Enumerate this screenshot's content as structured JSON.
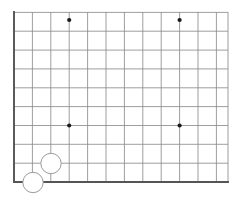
{
  "figure": {
    "kind": "go-board-corner-diagram",
    "width": 245,
    "height": 200,
    "background_color": "#ffffff"
  },
  "board": {
    "orientation": "lower-left-corner",
    "edge_line_color": "#555555",
    "edge_line_width": 1.9,
    "grid_line_color": "#8d8d8d",
    "grid_line_width": 0.85,
    "origin_x": 14,
    "origin_y": 182,
    "cell_width": 18.4,
    "cell_height": 18.85,
    "columns_shown": 12,
    "rows_shown": 9,
    "left_edge_x": 14,
    "bottom_edge_y": 182,
    "right_extent_x": 228,
    "top_extent_y": 12,
    "vertical_line_x": [
      14,
      32.4,
      50.8,
      69.2,
      87.6,
      106,
      124.4,
      142.8,
      161.2,
      179.6,
      198,
      216.4
    ],
    "horizontal_line_y": [
      182,
      163.2,
      144.3,
      125.5,
      106.6,
      87.8,
      68.9,
      50.1,
      31.2,
      12.4
    ],
    "right_stub_x": 228
  },
  "star_points": {
    "label": "hoshi",
    "color": "#1a1a1a",
    "radius": 2.1,
    "points": [
      {
        "name": "star-point-4-4-lower-left",
        "x": 69.2,
        "y": 125.5
      },
      {
        "name": "star-point-4-10-lower-right",
        "x": 179.6,
        "y": 125.5
      },
      {
        "name": "star-point-4-4-upper-left",
        "x": 69.2,
        "y": 20.0
      },
      {
        "name": "star-point-4-10-upper-right",
        "x": 179.6,
        "y": 20.0
      }
    ]
  },
  "stones": {
    "white_fill": "#ffffff",
    "white_stroke": "#9a9a9a",
    "stroke_width": 1.0,
    "radius": 10.2,
    "items": [
      {
        "name": "white-stone-1",
        "color": "white",
        "x": 51.0,
        "y": 163.5
      },
      {
        "name": "white-stone-2",
        "color": "white",
        "x": 33.0,
        "y": 182.5
      }
    ]
  }
}
